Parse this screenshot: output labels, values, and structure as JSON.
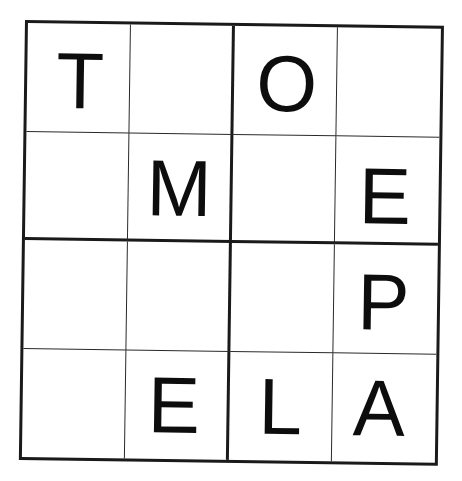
{
  "puzzle": {
    "rows": 4,
    "cols": 4,
    "box_rows": 2,
    "box_cols": 2,
    "cells": [
      [
        {
          "value": "T",
          "ox": 52,
          "oy": 53
        },
        {
          "value": "",
          "ox": 50,
          "oy": 50
        },
        {
          "value": "O",
          "ox": 52,
          "oy": 53
        },
        {
          "value": "",
          "ox": 50,
          "oy": 50
        }
      ],
      [
        {
          "value": "",
          "ox": 50,
          "oy": 50
        },
        {
          "value": "M",
          "ox": 50,
          "oy": 52
        },
        {
          "value": "",
          "ox": 50,
          "oy": 50
        },
        {
          "value": "E",
          "ox": 48,
          "oy": 56
        }
      ],
      [
        {
          "value": "",
          "ox": 50,
          "oy": 50
        },
        {
          "value": "",
          "ox": 50,
          "oy": 50
        },
        {
          "value": "",
          "ox": 50,
          "oy": 50
        },
        {
          "value": "P",
          "ox": 48,
          "oy": 53
        }
      ],
      [
        {
          "value": "",
          "ox": 50,
          "oy": 50
        },
        {
          "value": "E",
          "ox": 48,
          "oy": 50
        },
        {
          "value": "L",
          "ox": 50,
          "oy": 50
        },
        {
          "value": "A",
          "ox": 45,
          "oy": 50
        }
      ]
    ]
  },
  "colors": {
    "grid_line": "#1a1a1a",
    "letter": "#0d0d0d",
    "background": "#ffffff"
  }
}
